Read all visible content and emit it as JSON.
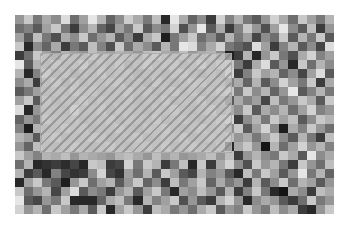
{
  "image": {
    "kind": "grayscale-noise-grid",
    "cols": 35,
    "rows": 22,
    "background": "#ffffff"
  },
  "selection": {
    "style": "translucent-hatched",
    "fill": "#cdcdcd",
    "hatch_color": "#787878",
    "col_start": 3,
    "row_start": 4,
    "col_span": 21,
    "row_span": 11
  },
  "grid": [
    [
      150,
      200,
      120,
      170,
      140,
      220,
      110,
      160,
      230,
      180,
      100,
      140,
      205,
      170,
      120,
      190,
      40,
      230,
      170,
      100,
      140,
      60,
      210,
      130,
      180,
      120,
      90,
      150,
      210,
      170,
      110,
      200,
      160,
      120,
      180
    ],
    [
      110,
      130,
      90,
      160,
      200,
      120,
      60,
      140,
      180,
      100,
      70,
      160,
      120,
      200,
      90,
      140,
      120,
      210,
      80,
      150,
      230,
      90,
      170,
      60,
      130,
      200,
      150,
      80,
      160,
      230,
      140,
      90,
      190,
      60,
      150
    ],
    [
      160,
      90,
      190,
      120,
      80,
      170,
      140,
      200,
      110,
      150,
      180,
      90,
      140,
      60,
      170,
      200,
      30,
      120,
      160,
      200,
      110,
      140,
      90,
      180,
      120,
      160,
      70,
      140,
      110,
      200,
      90,
      180,
      120,
      200,
      90
    ],
    [
      200,
      40,
      140,
      100,
      170,
      60,
      120,
      90,
      190,
      130,
      80,
      200,
      110,
      170,
      140,
      90,
      180,
      120,
      230,
      220,
      130,
      170,
      210,
      120,
      100,
      80,
      220,
      160,
      60,
      130,
      180,
      90,
      140,
      70,
      220
    ],
    [
      60,
      110,
      200,
      160,
      130,
      180,
      160,
      150,
      190,
      170,
      160,
      180,
      170,
      150,
      190,
      200,
      170,
      160,
      190,
      150,
      170,
      180,
      140,
      30,
      60,
      180,
      40,
      150,
      200,
      120,
      80,
      170,
      210,
      130,
      160
    ],
    [
      230,
      90,
      180,
      150,
      190,
      160,
      170,
      200,
      150,
      180,
      160,
      190,
      140,
      170,
      200,
      160,
      180,
      190,
      150,
      170,
      200,
      160,
      190,
      200,
      120,
      60,
      170,
      220,
      90,
      150,
      40,
      200,
      110,
      180,
      140
    ],
    [
      180,
      40,
      130,
      200,
      150,
      180,
      140,
      170,
      160,
      190,
      150,
      170,
      180,
      140,
      160,
      170,
      150,
      180,
      190,
      160,
      140,
      170,
      150,
      210,
      60,
      130,
      200,
      160,
      180,
      100,
      140,
      70,
      160,
      220,
      90
    ],
    [
      140,
      170,
      60,
      160,
      190,
      140,
      180,
      150,
      170,
      160,
      180,
      190,
      150,
      170,
      140,
      190,
      160,
      150,
      170,
      190,
      180,
      160,
      170,
      130,
      170,
      100,
      180,
      90,
      140,
      210,
      160,
      120,
      200,
      60,
      170
    ],
    [
      90,
      120,
      160,
      150,
      170,
      160,
      190,
      170,
      180,
      150,
      160,
      170,
      190,
      160,
      180,
      150,
      170,
      190,
      160,
      180,
      150,
      170,
      190,
      200,
      120,
      200,
      140,
      180,
      100,
      150,
      230,
      90,
      130,
      180,
      120
    ],
    [
      160,
      200,
      90,
      180,
      150,
      170,
      160,
      190,
      150,
      180,
      170,
      160,
      180,
      150,
      170,
      160,
      190,
      150,
      170,
      160,
      190,
      150,
      160,
      90,
      170,
      130,
      160,
      70,
      190,
      120,
      150,
      200,
      170,
      90,
      200
    ],
    [
      220,
      40,
      150,
      170,
      160,
      150,
      210,
      160,
      170,
      190,
      150,
      180,
      170,
      160,
      150,
      180,
      170,
      190,
      160,
      150,
      170,
      190,
      150,
      170,
      140,
      200,
      90,
      170,
      140,
      180,
      110,
      160,
      210,
      130,
      150
    ],
    [
      100,
      150,
      120,
      190,
      170,
      160,
      180,
      150,
      160,
      170,
      190,
      150,
      180,
      170,
      160,
      190,
      150,
      170,
      180,
      160,
      150,
      170,
      190,
      210,
      60,
      140,
      180,
      120,
      200,
      160,
      190,
      90,
      140,
      200,
      180
    ],
    [
      130,
      30,
      180,
      150,
      160,
      190,
      170,
      180,
      150,
      160,
      170,
      190,
      160,
      150,
      180,
      170,
      190,
      160,
      150,
      170,
      190,
      160,
      180,
      140,
      200,
      90,
      160,
      210,
      140,
      30,
      170,
      130,
      200,
      150,
      110
    ],
    [
      180,
      160,
      90,
      170,
      190,
      150,
      160,
      170,
      190,
      180,
      150,
      160,
      170,
      190,
      150,
      160,
      180,
      170,
      190,
      150,
      160,
      180,
      170,
      190,
      150,
      170,
      120,
      160,
      200,
      140,
      90,
      180,
      120,
      60,
      190
    ],
    [
      150,
      100,
      190,
      160,
      150,
      170,
      190,
      160,
      150,
      170,
      190,
      160,
      150,
      170,
      180,
      160,
      190,
      150,
      170,
      190,
      160,
      150,
      180,
      40,
      170,
      200,
      150,
      20,
      180,
      110,
      160,
      210,
      150,
      180,
      130
    ],
    [
      200,
      160,
      130,
      180,
      170,
      190,
      150,
      180,
      170,
      160,
      150,
      180,
      190,
      170,
      150,
      190,
      160,
      180,
      150,
      160,
      170,
      190,
      150,
      190,
      60,
      150,
      180,
      140,
      120,
      200,
      170,
      90,
      230,
      140,
      170
    ],
    [
      110,
      180,
      40,
      50,
      60,
      45,
      70,
      40,
      200,
      190,
      60,
      70,
      210,
      120,
      200,
      180,
      60,
      120,
      190,
      40,
      200,
      60,
      170,
      210,
      140,
      80,
      200,
      150,
      180,
      120,
      60,
      200,
      150,
      110,
      190
    ],
    [
      180,
      60,
      90,
      40,
      130,
      70,
      50,
      60,
      140,
      210,
      70,
      50,
      160,
      110,
      180,
      90,
      200,
      160,
      90,
      70,
      180,
      130,
      150,
      90,
      40,
      190,
      120,
      200,
      160,
      90,
      150,
      230,
      120,
      180,
      100
    ],
    [
      40,
      160,
      200,
      120,
      90,
      30,
      150,
      200,
      110,
      160,
      180,
      90,
      150,
      200,
      100,
      140,
      60,
      190,
      120,
      160,
      200,
      100,
      170,
      120,
      150,
      60,
      180,
      90,
      140,
      200,
      110,
      180,
      160,
      90,
      150
    ],
    [
      200,
      110,
      150,
      180,
      70,
      160,
      220,
      90,
      140,
      120,
      60,
      150,
      180,
      90,
      160,
      200,
      120,
      40,
      160,
      140,
      190,
      150,
      90,
      180,
      60,
      130,
      200,
      120,
      40,
      20,
      170,
      140,
      60,
      190,
      170
    ],
    [
      230,
      90,
      70,
      150,
      120,
      200,
      40,
      40,
      40,
      100,
      170,
      190,
      120,
      40,
      180,
      130,
      160,
      200,
      80,
      150,
      90,
      60,
      180,
      210,
      150,
      40,
      140,
      170,
      150,
      90,
      60,
      110,
      200,
      120,
      150
    ],
    [
      210,
      150,
      180,
      110,
      200,
      160,
      120,
      170,
      90,
      200,
      40,
      160,
      200,
      150,
      60,
      190,
      170,
      120,
      150,
      110,
      170,
      200,
      90,
      150,
      130,
      200,
      150,
      120,
      190,
      140,
      170,
      60,
      40,
      150,
      200
    ]
  ]
}
